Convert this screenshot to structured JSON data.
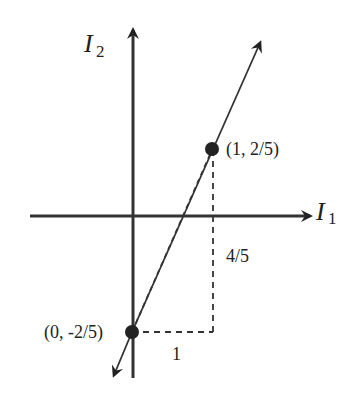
{
  "diagram": {
    "type": "coordinate-line-plot",
    "axes": {
      "x_label": "I",
      "x_subscript": "1",
      "y_label": "I",
      "y_subscript": "2"
    },
    "points": [
      {
        "label": "(1, 2/5)",
        "x": 1,
        "y": 0.4
      },
      {
        "label": "(0, -2/5)",
        "x": 0,
        "y": -0.4
      }
    ],
    "annotations": {
      "run_label": "1",
      "rise_label": "4/5"
    },
    "colors": {
      "ink": "#222222",
      "background": "#ffffff"
    }
  }
}
